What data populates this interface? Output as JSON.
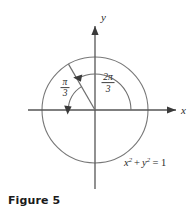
{
  "figure": {
    "caption": "Figure 5",
    "axes": {
      "x_label": "x",
      "y_label": "y"
    },
    "equation": {
      "base_x": "x",
      "exp_x": "2",
      "plus": "+",
      "base_y": "y",
      "exp_y": "2",
      "equals": "=",
      "value": "1",
      "full": "x2 + y2 = 1"
    },
    "angles": [
      {
        "id": "reference-angle",
        "numerator": "π",
        "denominator": "3",
        "label": "π/3",
        "description": "reference angle from terminal ray to negative x-axis"
      },
      {
        "id": "standard-angle",
        "numerator": "2π",
        "denominator": "3",
        "label": "2π/3",
        "description": "angle from positive x-axis counterclockwise to terminal ray"
      }
    ],
    "geometry": {
      "center_x": 95,
      "center_y": 110,
      "radius": 53,
      "terminal_angle_degrees": 120
    },
    "colors": {
      "stroke": "#6e6e6e",
      "axis": "#555555",
      "text": "#2a2a2a",
      "caption": "#1a1a1a",
      "background": "#ffffff"
    }
  }
}
